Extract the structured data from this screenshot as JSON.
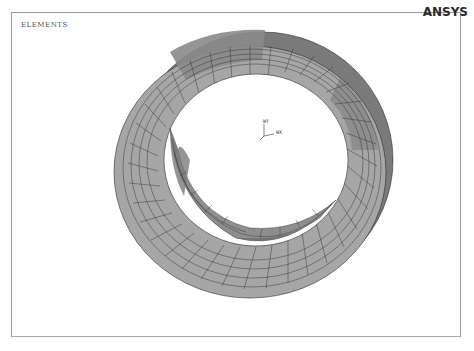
{
  "window": {
    "plot_label": "ELEMENTS",
    "brand": "ANSYS"
  },
  "triad": {
    "y_label": "WY",
    "x_label": "WX",
    "z_label": "WZ"
  },
  "model": {
    "type": "annular ring mesh",
    "colors": {
      "face_light": "#a6a6a6",
      "face_mid": "#8e8e8e",
      "face_dark": "#6e6e6e",
      "mesh_lines": "#2e2e2e",
      "background": "#ffffff",
      "frame_border": "#9a9a9a"
    }
  }
}
